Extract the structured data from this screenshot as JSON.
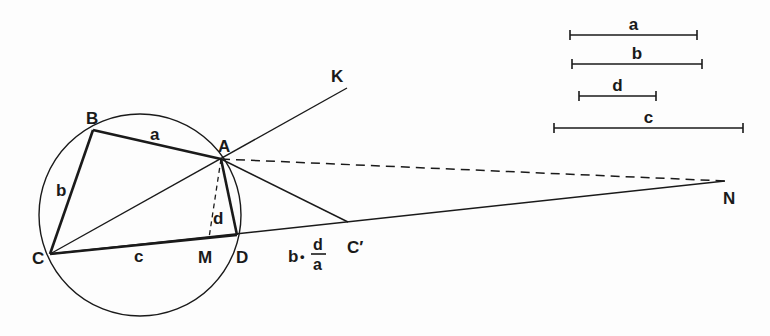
{
  "diagram": {
    "points": {
      "A": {
        "label": "A",
        "x": 221,
        "y": 159
      },
      "B": {
        "label": "B",
        "x": 93,
        "y": 130
      },
      "C": {
        "label": "C",
        "x": 50,
        "y": 254
      },
      "D": {
        "label": "D",
        "x": 237,
        "y": 235
      },
      "M": {
        "label": "M",
        "x": 209,
        "y": 238
      },
      "K": {
        "label": "K",
        "x": 347,
        "y": 88
      },
      "Cprime": {
        "label": "C′",
        "x": 348,
        "y": 222
      },
      "N": {
        "label": "N",
        "x": 725,
        "y": 181
      }
    },
    "circle": {
      "cx": 140,
      "cy": 215,
      "r": 101
    },
    "side_labels": {
      "a": "a",
      "b": "b",
      "c": "c",
      "d": "d"
    },
    "formula": {
      "prefix": "b",
      "dot": "•",
      "numerator": "d",
      "denominator": "a"
    },
    "reference_segments": [
      {
        "label": "a",
        "x1": 570,
        "x2": 697,
        "y": 35
      },
      {
        "label": "b",
        "x1": 572,
        "x2": 702,
        "y": 64
      },
      {
        "label": "d",
        "x1": 579,
        "x2": 656,
        "y": 96
      },
      {
        "label": "c",
        "x1": 554,
        "x2": 743,
        "y": 128
      }
    ],
    "stroke_color": "#1a1a1a",
    "background_color": "#fdfdfd"
  }
}
